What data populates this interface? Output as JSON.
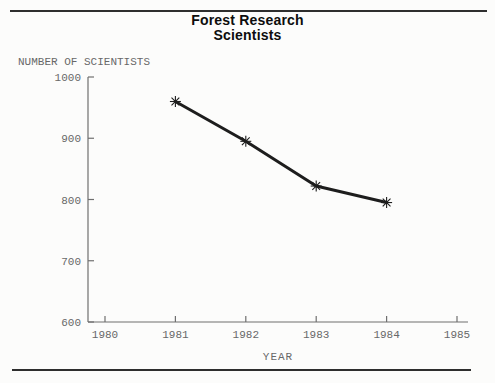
{
  "page": {
    "background": "#fcfcfb"
  },
  "rules": {
    "color": "#2e2e2e"
  },
  "chart_data": {
    "type": "line",
    "title": "Forest Research Scientists",
    "title_line1": "Forest Research",
    "title_line2": "Scientists",
    "ylabel": "NUMBER OF SCIENTISTS",
    "xlabel": "YEAR",
    "x": [
      1981,
      1982,
      1983,
      1984
    ],
    "values": [
      960,
      895,
      822,
      795
    ],
    "x_ticks": [
      1980,
      1981,
      1982,
      1983,
      1984,
      1985
    ],
    "y_ticks": [
      600,
      700,
      800,
      900,
      1000
    ],
    "xlim": [
      1980,
      1985
    ],
    "ylim": [
      600,
      1000
    ],
    "grid": false,
    "legend": false,
    "marker": "8-point-star",
    "line_color": "#1d1d1d",
    "axis_color": "#6f6f6f",
    "text_color": "#686868",
    "title_color": "#0d0d0d"
  }
}
